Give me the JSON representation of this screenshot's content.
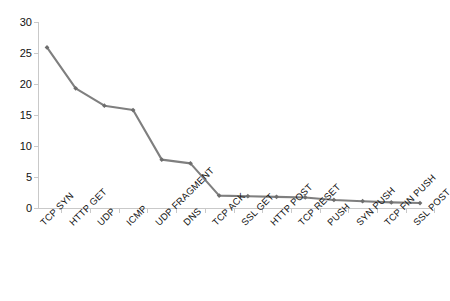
{
  "chart_data": {
    "type": "line",
    "title": "",
    "subtitle": "",
    "xlabel": "",
    "ylabel": "",
    "categories": [
      "TCP SYN",
      "HTTP GET",
      "UDP",
      "ICMP",
      "UDP FRAGMENT",
      "DNS",
      "TCP ACK",
      "SSL GET",
      "HTTP POST",
      "TCP RESET",
      "PUSH",
      "SYN PUSH",
      "TCP FIN PUSH",
      "SSL POST"
    ],
    "values": [
      25.9,
      19.3,
      16.5,
      15.8,
      7.8,
      7.2,
      2.0,
      1.9,
      1.8,
      1.7,
      1.3,
      1.1,
      0.9,
      0.8
    ],
    "series": [
      {
        "name": "Attack type distribution",
        "values": [
          25.9,
          19.3,
          16.5,
          15.8,
          7.8,
          7.2,
          2.0,
          1.9,
          1.8,
          1.7,
          1.3,
          1.1,
          0.9,
          0.8
        ]
      }
    ],
    "ylim": [
      0,
      30
    ],
    "yticks": [
      0,
      5,
      10,
      15,
      20,
      25,
      30
    ],
    "ytick_labels": [
      "0",
      "5",
      "10",
      "15",
      "20",
      "25",
      "30"
    ],
    "grid": false,
    "legend": false,
    "legend_position": "none",
    "marker": "diamond",
    "line_color": "#7f7f7f",
    "marker_color": "#6e6e6e",
    "axis_color": "#c9c9c9",
    "tick_label_color": "#111111",
    "background_color": "#ffffff"
  }
}
